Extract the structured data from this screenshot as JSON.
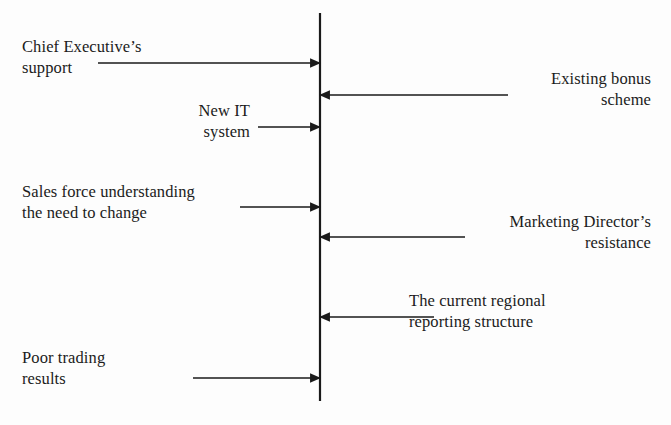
{
  "diagram": {
    "type": "force-field-analysis",
    "title": "",
    "background_color": "#fdfdfd",
    "line_color": "#1a1a1a",
    "center_line": {
      "name": "equilibrium-line",
      "x": 320,
      "y_top": 13,
      "y_bottom": 401,
      "stroke_width": 2.2
    },
    "driving_forces": [
      {
        "label": "Chief Executive’s\nsupport",
        "direction": "right",
        "arrow_y": 63,
        "arrow_x_start": 98,
        "arrow_x_end": 320,
        "text_x": 22,
        "text_y": 36,
        "text_align": "left"
      },
      {
        "label": "New IT\nsystem",
        "direction": "right",
        "arrow_y": 127,
        "arrow_x_start": 258,
        "arrow_x_end": 320,
        "text_x": 150,
        "text_y": 100,
        "text_width": 100,
        "text_align": "right"
      },
      {
        "label": "Sales force understanding\nthe need to change",
        "direction": "right",
        "arrow_y": 207,
        "arrow_x_start": 240,
        "arrow_x_end": 320,
        "text_x": 22,
        "text_y": 181,
        "text_align": "left"
      },
      {
        "label": "Poor trading\nresults",
        "direction": "right",
        "arrow_y": 378,
        "arrow_x_start": 193,
        "arrow_x_end": 320,
        "text_x": 22,
        "text_y": 347,
        "text_align": "left"
      }
    ],
    "restraining_forces": [
      {
        "label": "Existing bonus\nscheme",
        "direction": "left",
        "arrow_y": 95,
        "arrow_x_start": 508,
        "arrow_x_end": 320,
        "text_x": 455,
        "text_y": 68,
        "text_width": 196,
        "text_align": "right"
      },
      {
        "label": "Marketing Director’s\nresistance",
        "direction": "left",
        "arrow_y": 237,
        "arrow_x_start": 465,
        "arrow_x_end": 320,
        "text_x": 420,
        "text_y": 211,
        "text_width": 231,
        "text_align": "right"
      },
      {
        "label": "The current regional\nreporting structure",
        "direction": "left",
        "arrow_y": 317,
        "arrow_x_start": 434,
        "arrow_x_end": 320,
        "text_x": 409,
        "text_y": 290,
        "text_width": 240,
        "text_align": "left"
      }
    ]
  }
}
